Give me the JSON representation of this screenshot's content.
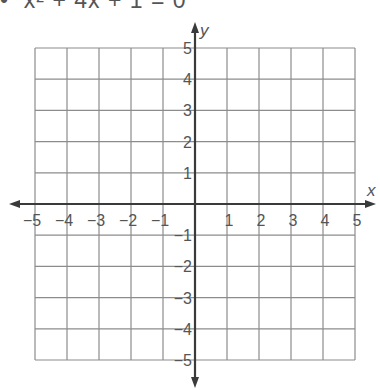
{
  "header": {
    "equation_text": "•  x² + 4x + 1 = 0"
  },
  "chart_data": {
    "type": "scatter",
    "title": "",
    "xlabel": "x",
    "ylabel": "y",
    "xlim": [
      -5,
      5
    ],
    "ylim": [
      -5,
      5
    ],
    "grid": true,
    "x_ticks": [
      "-5",
      "-4",
      "-3",
      "-2",
      "-1",
      "1",
      "2",
      "3",
      "4",
      "5"
    ],
    "y_ticks": [
      "5",
      "4",
      "3",
      "2",
      "1",
      "-1",
      "-2",
      "-3",
      "-4",
      "-5"
    ],
    "series": [],
    "note": "Empty coordinate grid for graphing; no data plotted",
    "colors": {
      "grid": "#8c8c8c",
      "axis": "#3a3a3a",
      "text": "#555555"
    }
  }
}
